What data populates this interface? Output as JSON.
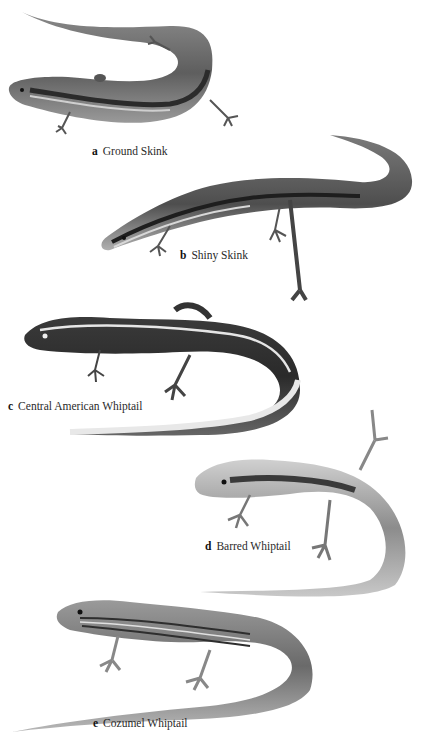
{
  "plate": {
    "figures": [
      {
        "letter": "a",
        "name": "Ground Skink"
      },
      {
        "letter": "b",
        "name": "Shiny Skink"
      },
      {
        "letter": "c",
        "name": "Central American Whiptail"
      },
      {
        "letter": "d",
        "name": "Barred Whiptail"
      },
      {
        "letter": "e",
        "name": "Cozumel Whiptail"
      }
    ]
  },
  "colors": {
    "background": "#ffffff",
    "skink_body": "#6e6e6e",
    "skink_stripe": "#2b2b2b",
    "whiptail_light": "#d8d8d8",
    "whiptail_dark": "#3a3a3a",
    "caption_text": "#2a2a2a"
  }
}
